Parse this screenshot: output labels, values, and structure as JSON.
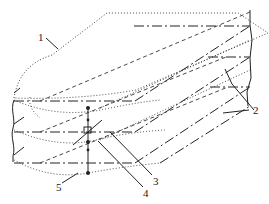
{
  "figure": {
    "type": "isometric technical drawing",
    "labels": [
      {
        "id": "1",
        "text": "1",
        "x": 40,
        "y": 37
      },
      {
        "id": "2",
        "text": "2",
        "x": 254,
        "y": 112
      },
      {
        "id": "3",
        "text": "3",
        "x": 155,
        "y": 183
      },
      {
        "id": "4",
        "text": "4",
        "x": 145,
        "y": 195
      },
      {
        "id": "5",
        "text": "5",
        "x": 58,
        "y": 189
      }
    ],
    "line_styles": [
      "solid",
      "dotted",
      "dashed",
      "dash-dot (chain)"
    ],
    "colors": {
      "ink": "#222222",
      "background": "#ffffff"
    }
  }
}
